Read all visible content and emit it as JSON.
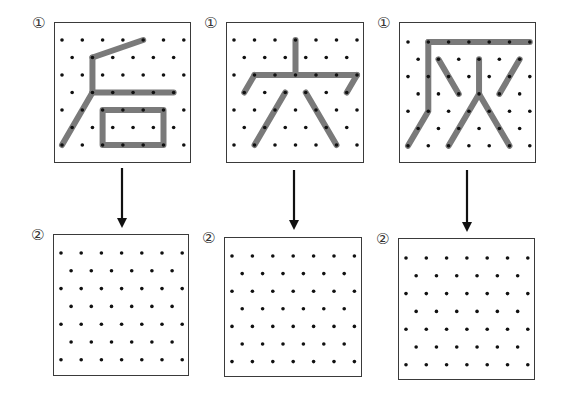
{
  "colors": {
    "border": "#3a3a3a",
    "dot": "#111111",
    "stroke": "#7a7a7a",
    "arrow": "#111111"
  },
  "grid": {
    "rows": 7,
    "even_row_cols": 7,
    "odd_row_cols": 6
  },
  "top_panels": [
    {
      "label": "①",
      "box": [
        54,
        22,
        137,
        141
      ],
      "origin": [
        62,
        40
      ],
      "dx": 20.3,
      "dy": 17.5,
      "strokes": [
        [
          [
            1.5,
            1
          ],
          [
            4,
            0
          ]
        ],
        [
          [
            1.5,
            1
          ],
          [
            1.5,
            3
          ]
        ],
        [
          [
            1.5,
            3
          ],
          [
            5.5,
            3
          ]
        ],
        [
          [
            1.5,
            3
          ],
          [
            0,
            6
          ]
        ],
        [
          [
            2,
            4
          ],
          [
            5,
            4
          ],
          [
            5,
            6
          ],
          [
            2,
            6
          ],
          [
            2,
            4
          ]
        ]
      ]
    },
    {
      "label": "①",
      "box": [
        226,
        22,
        138,
        141
      ],
      "origin": [
        234,
        40
      ],
      "dx": 20.5,
      "dy": 17.5,
      "strokes": [
        [
          [
            3,
            0
          ],
          [
            3,
            2
          ]
        ],
        [
          [
            1,
            2
          ],
          [
            6,
            2
          ]
        ],
        [
          [
            1,
            2
          ],
          [
            0.5,
            3
          ]
        ],
        [
          [
            6,
            2
          ],
          [
            5.5,
            3
          ]
        ],
        [
          [
            2.5,
            3
          ],
          [
            1,
            6
          ]
        ],
        [
          [
            3.5,
            3
          ],
          [
            5,
            6
          ]
        ]
      ]
    },
    {
      "label": "①",
      "box": [
        399,
        22,
        137,
        141
      ],
      "origin": [
        408,
        42
      ],
      "dx": 20.3,
      "dy": 17.3,
      "strokes": [
        [
          [
            1,
            0
          ],
          [
            6,
            0
          ]
        ],
        [
          [
            1,
            0
          ],
          [
            1,
            4
          ],
          [
            0,
            6
          ]
        ],
        [
          [
            1.5,
            1
          ],
          [
            2.5,
            3
          ]
        ],
        [
          [
            3.5,
            1
          ],
          [
            3.5,
            3
          ]
        ],
        [
          [
            5.5,
            1
          ],
          [
            4.5,
            3
          ]
        ],
        [
          [
            3.5,
            3
          ],
          [
            2,
            6
          ]
        ],
        [
          [
            3.5,
            3
          ],
          [
            5,
            6
          ]
        ]
      ]
    }
  ],
  "bottom_panels": [
    {
      "label": "②",
      "box": [
        53,
        234,
        136,
        142
      ],
      "origin": [
        61,
        253
      ],
      "dx": 20.2,
      "dy": 17.8
    },
    {
      "label": "②",
      "box": [
        224,
        237,
        138,
        140
      ],
      "origin": [
        232,
        256
      ],
      "dx": 20.4,
      "dy": 17.6
    },
    {
      "label": "②",
      "box": [
        398,
        238,
        137,
        142
      ],
      "origin": [
        406,
        258
      ],
      "dx": 20.3,
      "dy": 17.8
    }
  ],
  "arrows": [
    {
      "x": 122,
      "y1": 168,
      "y2": 228
    },
    {
      "x": 294,
      "y1": 170,
      "y2": 230
    },
    {
      "x": 467,
      "y1": 170,
      "y2": 232
    }
  ],
  "labels": {
    "top": "①",
    "bottom": "②"
  }
}
